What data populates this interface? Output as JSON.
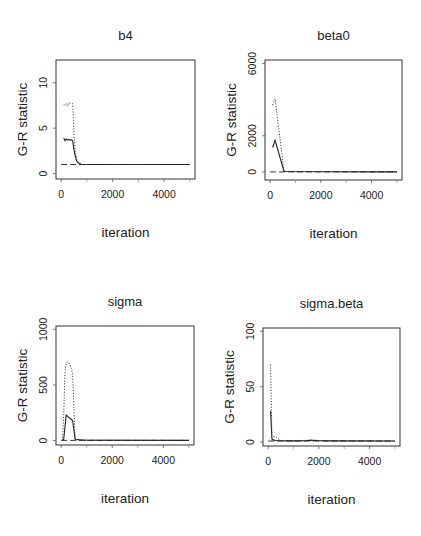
{
  "figure": {
    "ylabel": "G-R statistic",
    "xlabel": "iteration"
  },
  "chart_data": [
    {
      "type": "line",
      "title": "b4",
      "xlabel": "iteration",
      "ylabel": "G-R statistic",
      "xlim": [
        -200,
        5200
      ],
      "ylim": [
        -0.6,
        12.5
      ],
      "xticks": [
        0,
        2000,
        4000
      ],
      "yticks": [
        0,
        5,
        10
      ],
      "grid": false,
      "legend": null,
      "box": {
        "left": 56,
        "top": 60,
        "right": 195,
        "bottom": 179
      },
      "series": [
        {
          "name": "median (solid)",
          "style": "solid",
          "x": [
            100,
            150,
            200,
            250,
            300,
            400,
            450,
            500,
            550,
            600,
            650,
            700,
            750,
            800,
            5000
          ],
          "y": [
            3.9,
            3.6,
            3.8,
            3.7,
            3.7,
            3.7,
            3.6,
            2.6,
            1.9,
            1.4,
            1.2,
            1.1,
            1.05,
            1.0,
            1.0
          ]
        },
        {
          "name": "97.5% quantile (dotted)",
          "style": "dotted",
          "x": [
            100,
            150,
            200,
            250,
            300,
            400,
            450,
            500,
            550,
            600,
            650,
            700,
            750,
            800,
            5000
          ],
          "y": [
            7.6,
            7.5,
            7.7,
            7.4,
            7.8,
            7.7,
            7.7,
            4.5,
            2.4,
            1.6,
            1.3,
            1.15,
            1.05,
            1.0,
            1.0
          ]
        },
        {
          "name": "reference line at 1 (dashed)",
          "style": "dashed",
          "x": [
            0,
            5000
          ],
          "y": [
            1,
            1
          ]
        }
      ]
    },
    {
      "type": "line",
      "title": "beta0",
      "xlabel": "iteration",
      "ylabel": "G-R statistic",
      "xlim": [
        -200,
        5200
      ],
      "ylim": [
        -450,
        6200
      ],
      "xticks": [
        0,
        2000,
        4000
      ],
      "yticks": [
        0,
        2000,
        6000
      ],
      "grid": false,
      "legend": null,
      "box": {
        "left": 265,
        "top": 60,
        "right": 402,
        "bottom": 180
      },
      "series": [
        {
          "name": "median (solid)",
          "style": "solid",
          "x": [
            100,
            200,
            550,
            5000
          ],
          "y": [
            1350,
            1750,
            20,
            1
          ]
        },
        {
          "name": "97.5% quantile (dotted)",
          "style": "dotted",
          "x": [
            100,
            200,
            550,
            5000
          ],
          "y": [
            3700,
            4050,
            30,
            1
          ]
        },
        {
          "name": "reference line at 1 (dashed)",
          "style": "dashed",
          "x": [
            0,
            5000
          ],
          "y": [
            1,
            1
          ]
        }
      ]
    },
    {
      "type": "line",
      "title": "sigma",
      "xlabel": "iteration",
      "ylabel": "G-R statistic",
      "xlim": [
        -200,
        5200
      ],
      "ylim": [
        -40,
        1030
      ],
      "xticks": [
        0,
        2000,
        4000
      ],
      "yticks": [
        0,
        500,
        1000
      ],
      "grid": false,
      "legend": null,
      "box": {
        "left": 56,
        "top": 326,
        "right": 194,
        "bottom": 445
      },
      "series": [
        {
          "name": "median (solid)",
          "style": "solid",
          "x": [
            50,
            100,
            200,
            450,
            550,
            700,
            1000,
            5000
          ],
          "y": [
            1,
            10,
            230,
            180,
            10,
            8,
            2,
            1
          ]
        },
        {
          "name": "97.5% quantile (dotted)",
          "style": "dotted",
          "x": [
            50,
            100,
            150,
            200,
            250,
            300,
            350,
            400,
            450,
            500,
            550,
            700,
            5000
          ],
          "y": [
            1,
            220,
            600,
            700,
            710,
            700,
            680,
            650,
            600,
            300,
            10,
            5,
            1
          ]
        },
        {
          "name": "reference line at 1 (dashed)",
          "style": "dashed",
          "x": [
            0,
            5000
          ],
          "y": [
            1,
            1
          ]
        }
      ]
    },
    {
      "type": "line",
      "title": "sigma.beta",
      "xlabel": "iteration",
      "ylabel": "G-R statistic",
      "xlim": [
        -200,
        5200
      ],
      "ylim": [
        -3.5,
        103
      ],
      "xticks": [
        0,
        2000,
        4000
      ],
      "yticks": [
        0,
        50,
        100
      ],
      "grid": false,
      "legend": null,
      "box": {
        "left": 263,
        "top": 328,
        "right": 400,
        "bottom": 446
      },
      "series": [
        {
          "name": "median (solid)",
          "style": "solid",
          "x": [
            100,
            150,
            200,
            300,
            500,
            1000,
            1500,
            1700,
            2000,
            2500,
            5000
          ],
          "y": [
            28,
            3,
            2,
            1.5,
            1.2,
            1.1,
            1.3,
            1.6,
            1.2,
            1.1,
            1.0
          ]
        },
        {
          "name": "97.5% quantile (dotted)",
          "style": "dotted",
          "x": [
            100,
            150,
            200,
            300,
            400,
            500,
            1000,
            1500,
            1700,
            2000,
            2500,
            5000
          ],
          "y": [
            70,
            6,
            5,
            5,
            3,
            1.5,
            1.2,
            1.6,
            2.0,
            1.5,
            1.2,
            1.0
          ]
        },
        {
          "name": "reference line at 1 (dashed)",
          "style": "dashed",
          "x": [
            0,
            5000
          ],
          "y": [
            1,
            1
          ]
        }
      ]
    }
  ],
  "panels": [
    {
      "title": "b4",
      "ylabel": "G-R statistic",
      "xlabel": "iteration",
      "xtick_labels": [
        "0",
        "2000",
        "4000"
      ],
      "ytick_labels": [
        "0",
        "5",
        "10"
      ]
    },
    {
      "title": "beta0",
      "ylabel": "G-R statistic",
      "xlabel": "iteration",
      "xtick_labels": [
        "0",
        "2000",
        "4000"
      ],
      "ytick_labels": [
        "0",
        "2000",
        "6000"
      ]
    },
    {
      "title": "sigma",
      "ylabel": "G-R statistic",
      "xlabel": "iteration",
      "xtick_labels": [
        "0",
        "2000",
        "4000"
      ],
      "ytick_labels": [
        "0",
        "500",
        "1000"
      ]
    },
    {
      "title": "sigma.beta",
      "ylabel": "G-R statistic",
      "xlabel": "iteration",
      "xtick_labels": [
        "0",
        "2000",
        "4000"
      ],
      "ytick_labels": [
        "0",
        "50",
        "100"
      ]
    }
  ]
}
